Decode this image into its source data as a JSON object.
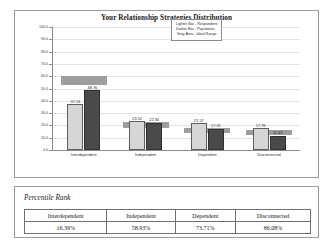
{
  "chart_panel": {
    "title": "Your Relationship Strategies Distribution",
    "legend": {
      "line1": "Lighter Bar - Respondent",
      "line2": "Darker Bar - Population",
      "line3": "Gray Area - Ideal Range"
    }
  },
  "table_section": {
    "caption": "Percentile Rank",
    "headers": [
      "Interdependent",
      "Independent",
      "Dependent",
      "Disconnected"
    ],
    "values": [
      "16.39%",
      "58.93%",
      "73.71%",
      "86.08%"
    ]
  },
  "chart_data": {
    "type": "bar",
    "title": "Your Relationship Strategies Distribution",
    "xlabel": "",
    "ylabel": "",
    "ylim": [
      0,
      100
    ],
    "yticks": [
      "0.0",
      "10.0",
      "20.0",
      "30.0",
      "40.0",
      "50.0",
      "60.0",
      "70.0",
      "80.0",
      "90.0",
      "100.0"
    ],
    "grid": true,
    "legend_position": "top-right",
    "categories": [
      "Interdependent",
      "Independent",
      "Dependent",
      "Disconnected"
    ],
    "series": [
      {
        "name": "Lighter Bar - Respondent",
        "values": [
          37.13,
          23.52,
          21.57,
          17.78
        ],
        "labels": [
          "37.13",
          "23.52",
          "21.57",
          "17.78"
        ],
        "color": "#d6d6d6"
      },
      {
        "name": "Darker Bar - Population",
        "values": [
          48.76,
          22.3,
          17.31,
          11.43
        ],
        "labels": [
          "48.76",
          "22.30",
          "17.31",
          "11.43"
        ],
        "color": "#4a4a4a"
      }
    ],
    "ideal_ranges": [
      {
        "category": "Interdependent",
        "low": 53.0,
        "high": 60.0
      },
      {
        "category": "Independent",
        "low": 18.0,
        "high": 23.0
      },
      {
        "category": "Dependent",
        "low": 14.0,
        "high": 18.0
      },
      {
        "category": "Disconnected",
        "low": 12.0,
        "high": 16.0
      }
    ]
  }
}
